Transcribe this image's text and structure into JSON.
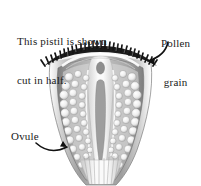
{
  "figure": {
    "background_color": "#ffffff",
    "ink_color": "#1a1a1a",
    "caption": {
      "line1": "This pistil is shown",
      "line2": "cut in half."
    },
    "labels": [
      {
        "id": "pollen-grain",
        "line1": "Pollen",
        "line2": "grain",
        "position": "top-right",
        "has_arrow": true,
        "arrow_points_to": "stigma-bristles"
      },
      {
        "id": "ovule",
        "text": "Ovule",
        "position": "left",
        "has_arrow": true,
        "arrow_points_to": "ovule-cluster"
      }
    ],
    "parts": {
      "stigma_bristles": {
        "name": "stigma-bristles",
        "color": "#1b1b1b",
        "description": "dark bristly band across the top of the pistil"
      },
      "ovary_wall": {
        "name": "ovary-wall",
        "color": "#8c8c8c"
      },
      "ovary_interior": {
        "name": "ovary-interior",
        "color": "#9a9a9a"
      },
      "style_canal": {
        "name": "style-canal",
        "color": "#f2f2f2"
      },
      "ovules": {
        "name": "ovule-cluster",
        "color": "#f0f0f0",
        "count_left": 31,
        "count_right": 31
      }
    },
    "colors": {
      "dark": "#1b1b1b",
      "mid_gray": "#8c8c8c",
      "light_gray": "#d8d8d8",
      "pale": "#f2f2f2",
      "white": "#ffffff"
    }
  }
}
